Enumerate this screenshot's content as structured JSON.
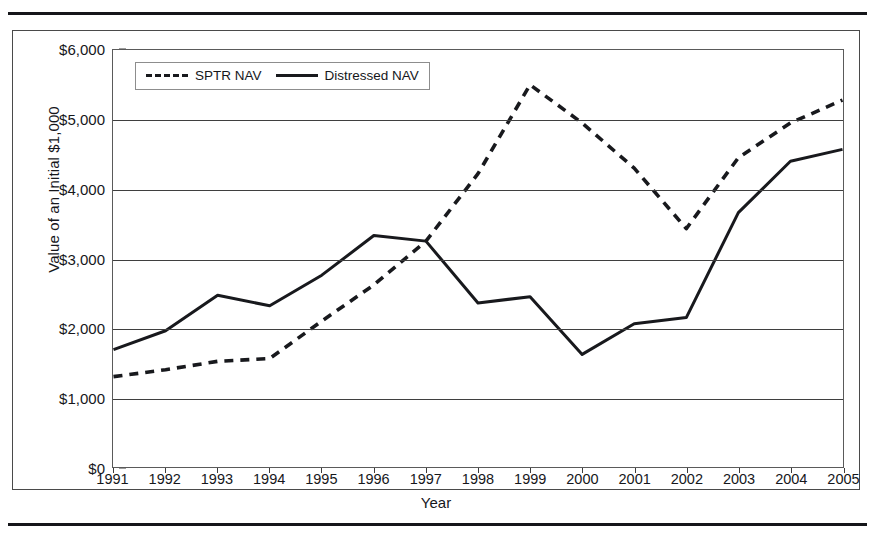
{
  "figure": {
    "y_axis_title": "Value of an Initial $1,000",
    "x_axis_title": "Year",
    "legend": [
      {
        "label": "SPTR NAV",
        "style": "dashed"
      },
      {
        "label": "Distressed NAV",
        "style": "solid"
      }
    ],
    "y_tick_labels": [
      "$6,000",
      "$5,000",
      "$4,000",
      "$3,000",
      "$2,000",
      "$1,000",
      "$0"
    ]
  },
  "chart_data": {
    "type": "line",
    "title": "",
    "xlabel": "Year",
    "ylabel": "Value of an Initial $1,000",
    "categories": [
      "1991",
      "1992",
      "1993",
      "1994",
      "1995",
      "1996",
      "1997",
      "1998",
      "1999",
      "2000",
      "2001",
      "2002",
      "2003",
      "2004",
      "2005"
    ],
    "x": [
      1991,
      1992,
      1993,
      1994,
      1995,
      1996,
      1997,
      1998,
      1999,
      2000,
      2001,
      2002,
      2003,
      2004,
      2005
    ],
    "ylim": [
      0,
      6000
    ],
    "yticks": [
      0,
      1000,
      2000,
      3000,
      4000,
      5000,
      6000
    ],
    "ytick_labels": [
      "$0",
      "$1,000",
      "$2,000",
      "$3,000",
      "$4,000",
      "$5,000",
      "$6,000"
    ],
    "grid": true,
    "legend_position": "top-left",
    "series": [
      {
        "name": "SPTR NAV",
        "style": "dashed",
        "color": "#18191d",
        "values": [
          1300,
          1400,
          1520,
          1560,
          2100,
          2620,
          3250,
          4220,
          5500,
          4950,
          4300,
          3430,
          4450,
          4950,
          5280
        ]
      },
      {
        "name": "Distressed NAV",
        "style": "solid",
        "color": "#18191d",
        "values": [
          1690,
          1960,
          2470,
          2320,
          2760,
          3330,
          3250,
          2360,
          2450,
          1620,
          2060,
          2150,
          3660,
          4400,
          4570
        ]
      }
    ]
  }
}
